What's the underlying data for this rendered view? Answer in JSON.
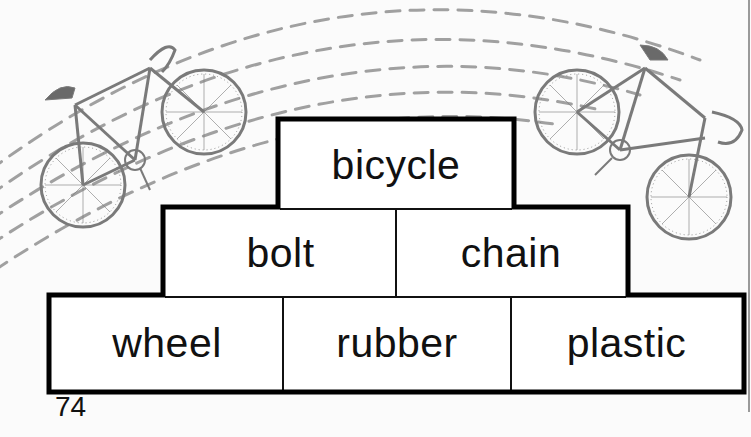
{
  "page": {
    "page_number": "74"
  },
  "illustration": {
    "left_icon": "bicycle-icon",
    "right_icon": "bicycle-icon",
    "arc_color": "#9a9a9a",
    "bike_color": "#8a8a8a"
  },
  "pyramid": {
    "top": [
      "bicycle"
    ],
    "middle": [
      "bolt",
      "chain"
    ],
    "bottom": [
      "wheel",
      "rubber",
      "plastic"
    ],
    "border_color": "#000000"
  }
}
